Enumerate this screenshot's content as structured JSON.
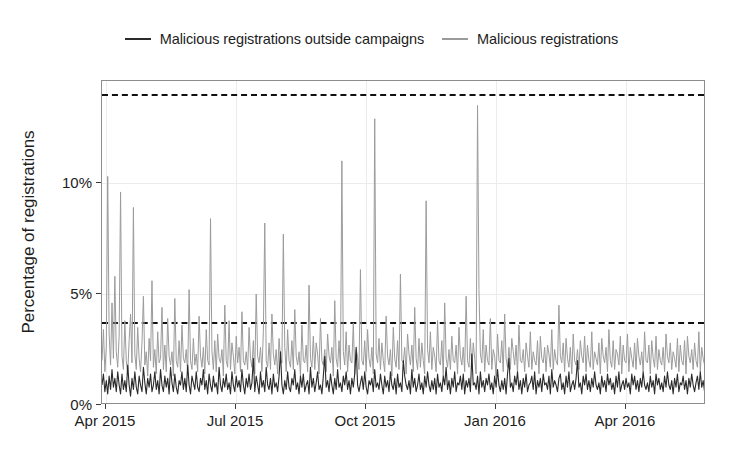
{
  "chart_data": {
    "type": "line",
    "title": "",
    "xlabel": "",
    "ylabel": "Percentage of registrations",
    "ylim": [
      0,
      14.6
    ],
    "xlim": [
      "2015-03-20",
      "2016-06-05"
    ],
    "grid": true,
    "legend_position": "top-center",
    "y_ticks": [
      {
        "value": 0,
        "label": "0%"
      },
      {
        "value": 5,
        "label": "5%"
      },
      {
        "value": 10,
        "label": "10%"
      }
    ],
    "x_ticks": [
      {
        "value": "2015-04-01",
        "label": "Apr 2015"
      },
      {
        "value": "2015-07-01",
        "label": "Jul 2015"
      },
      {
        "value": "2015-10-01",
        "label": "Oct 2015"
      },
      {
        "value": "2016-01-01",
        "label": "Jan 2016"
      },
      {
        "value": "2016-04-01",
        "label": "Apr 2016"
      }
    ],
    "annotations": [
      {
        "name": "upper-threshold",
        "type": "hline",
        "value": 14.0,
        "style": "dashed",
        "color": "#111111"
      },
      {
        "name": "lower-threshold",
        "type": "hline",
        "value": 3.75,
        "style": "dashed",
        "color": "#111111"
      }
    ],
    "series": [
      {
        "name": "Malicious registrations outside campaigns",
        "color": "#2b2b2b",
        "values": [
          0.9,
          1.4,
          0.6,
          1.1,
          0.5,
          1.3,
          0.7,
          1.6,
          0.8,
          1.2,
          0.6,
          1.5,
          0.9,
          0.5,
          1.4,
          0.7,
          1.1,
          0.6,
          1.8,
          0.9,
          0.4,
          1.2,
          0.7,
          1.5,
          0.8,
          0.5,
          1.3,
          0.9,
          0.6,
          1.7,
          1.0,
          0.5,
          1.2,
          0.8,
          1.4,
          0.6,
          0.9,
          1.5,
          0.7,
          1.1,
          0.5,
          1.6,
          0.9,
          0.6,
          1.3,
          0.8,
          1.2,
          0.5,
          1.7,
          1.0,
          0.6,
          1.4,
          0.8,
          0.5,
          1.1,
          0.9,
          1.5,
          0.7,
          1.2,
          0.6,
          1.8,
          0.9,
          0.5,
          1.3,
          1.0,
          0.7,
          1.5,
          0.8,
          0.6,
          1.2,
          0.9,
          1.6,
          0.7,
          1.1,
          0.5,
          1.4,
          0.9,
          0.6,
          1.3,
          0.8,
          1.0,
          0.5,
          1.7,
          0.9,
          0.6,
          1.2,
          0.8,
          1.4,
          0.7,
          1.0,
          0.5,
          1.5,
          0.9,
          0.6,
          1.3,
          0.8,
          1.1,
          0.6,
          1.6,
          0.9,
          0.5,
          1.2,
          0.8,
          1.4,
          0.7,
          1.0,
          2.1,
          0.6,
          1.3,
          0.9,
          0.5,
          1.5,
          0.8,
          1.1,
          0.6,
          1.7,
          0.9,
          0.7,
          1.2,
          0.5,
          1.4,
          0.8,
          1.0,
          0.6,
          1.3,
          2.4,
          0.9,
          0.5,
          1.1,
          0.7,
          1.5,
          0.8,
          0.6,
          1.2,
          0.9,
          1.6,
          0.7,
          1.0,
          0.5,
          1.3,
          0.8,
          1.4,
          0.6,
          0.9,
          1.1,
          0.5,
          1.7,
          0.8,
          1.2,
          0.6,
          1.0,
          1.5,
          0.7,
          0.9,
          0.5,
          1.3,
          2.2,
          0.8,
          1.1,
          0.6,
          1.4,
          0.9,
          0.5,
          1.2,
          0.7,
          1.6,
          0.8,
          1.0,
          0.6,
          1.3,
          0.9,
          1.5,
          0.7,
          1.1,
          0.5,
          1.2,
          0.8,
          1.4,
          2.6,
          0.9,
          0.6,
          1.0,
          1.3,
          0.7,
          1.5,
          0.8,
          0.5,
          1.1,
          0.9,
          1.2,
          0.6,
          1.6,
          0.8,
          1.0,
          0.7,
          1.4,
          0.9,
          0.5,
          1.3,
          0.8,
          1.1,
          0.6,
          1.5,
          0.9,
          0.7,
          1.2,
          0.5,
          1.4,
          0.8,
          1.0,
          0.6,
          2.0,
          1.3,
          0.9,
          0.7,
          1.1,
          0.5,
          1.6,
          0.8,
          1.2,
          0.6,
          0.9,
          1.4,
          0.7,
          1.0,
          0.5,
          1.3,
          0.8,
          1.5,
          0.9,
          0.6,
          1.1,
          0.7,
          1.2,
          0.5,
          1.4,
          0.8,
          1.0,
          0.6,
          1.3,
          0.9,
          1.7,
          0.7,
          1.1,
          0.5,
          1.2,
          0.8,
          1.5,
          0.6,
          1.0,
          0.9,
          1.3,
          0.7,
          1.4,
          0.5,
          1.1,
          0.8,
          1.2,
          0.6,
          2.3,
          0.9,
          1.0,
          0.7,
          1.3,
          0.5,
          1.5,
          0.8,
          1.1,
          0.6,
          1.2,
          0.9,
          1.4,
          0.7,
          1.0,
          0.5,
          1.3,
          0.8,
          1.6,
          0.9,
          0.6,
          1.1,
          0.7,
          1.2,
          0.5,
          1.4,
          2.1,
          0.8,
          1.0,
          0.6,
          1.3,
          0.9,
          1.5,
          0.7,
          1.1,
          0.5,
          1.2,
          0.8,
          1.4,
          0.6,
          0.9,
          1.0,
          1.3,
          0.7,
          1.5,
          0.5,
          1.1,
          0.8,
          1.2,
          0.6,
          1.4,
          0.9,
          1.0,
          0.7,
          1.3,
          0.5,
          1.6,
          0.8,
          1.1,
          0.9,
          0.6,
          1.2,
          1.4,
          0.7,
          1.0,
          0.5,
          1.3,
          0.8,
          1.5,
          0.6,
          0.9,
          1.1,
          0.7,
          1.2,
          2.0,
          0.8,
          1.0,
          0.5,
          1.3,
          0.9,
          1.4,
          0.7,
          1.1,
          0.6,
          1.2,
          0.8,
          1.5,
          0.9,
          0.7,
          1.0,
          0.5,
          1.3,
          0.8,
          1.1,
          0.6,
          1.4,
          0.9,
          1.2,
          0.7,
          1.0,
          0.5,
          1.3,
          0.8,
          1.5,
          0.6,
          0.9,
          1.1,
          0.7,
          1.2,
          0.8,
          1.0,
          0.5,
          1.4,
          0.9,
          1.3,
          0.7,
          1.1,
          0.6,
          1.2,
          0.8,
          1.5,
          0.9,
          0.7,
          1.0,
          0.6,
          1.3,
          0.8,
          1.1,
          0.5,
          1.4,
          0.9,
          1.2,
          0.7,
          1.0,
          0.6,
          1.3,
          0.8,
          1.5,
          0.9,
          0.7,
          1.1,
          0.5,
          1.2,
          0.8,
          1.4,
          0.6,
          1.0,
          0.9,
          1.3,
          0.7,
          1.1,
          0.5,
          1.2,
          0.8,
          1.4,
          0.9,
          0.6,
          1.0,
          1.3,
          0.7,
          1.5,
          0.8,
          1.1,
          0.6,
          1.2
        ]
      },
      {
        "name": "Malicious registrations",
        "color": "#9b9b9b",
        "values": [
          2.0,
          3.4,
          1.5,
          2.6,
          10.3,
          3.2,
          1.8,
          4.6,
          2.1,
          5.8,
          2.4,
          1.7,
          3.1,
          9.6,
          2.2,
          1.6,
          3.8,
          2.0,
          1.4,
          2.9,
          4.1,
          1.9,
          8.9,
          2.3,
          1.6,
          3.5,
          2.1,
          1.5,
          2.8,
          4.9,
          1.8,
          2.4,
          1.3,
          3.0,
          2.0,
          5.6,
          1.7,
          2.5,
          1.4,
          3.3,
          1.9,
          2.1,
          4.4,
          1.6,
          2.7,
          1.5,
          3.9,
          2.2,
          1.8,
          2.4,
          1.3,
          4.8,
          2.0,
          1.7,
          2.9,
          1.5,
          3.6,
          2.1,
          1.9,
          2.5,
          1.4,
          5.2,
          2.0,
          1.6,
          3.0,
          1.8,
          2.3,
          1.5,
          4.0,
          2.2,
          1.7,
          2.6,
          1.4,
          3.4,
          2.0,
          1.8,
          8.4,
          2.4,
          1.6,
          2.9,
          1.5,
          3.2,
          2.1,
          1.9,
          2.5,
          1.3,
          4.5,
          2.0,
          1.7,
          3.8,
          1.6,
          2.8,
          2.2,
          1.4,
          3.1,
          1.9,
          2.6,
          1.5,
          4.2,
          2.0,
          1.8,
          2.4,
          1.6,
          3.5,
          2.1,
          1.7,
          2.9,
          1.4,
          5.0,
          2.2,
          1.9,
          2.6,
          1.5,
          3.3,
          8.2,
          2.0,
          1.7,
          2.8,
          1.6,
          4.1,
          2.3,
          1.8,
          2.5,
          1.4,
          3.0,
          2.1,
          1.9,
          7.7,
          2.6,
          1.5,
          3.4,
          2.0,
          1.7,
          2.9,
          1.6,
          4.3,
          2.2,
          1.8,
          2.4,
          1.3,
          3.6,
          2.0,
          1.9,
          2.7,
          1.5,
          5.4,
          2.1,
          1.7,
          3.1,
          1.6,
          2.8,
          2.3,
          1.4,
          3.9,
          2.0,
          1.8,
          2.5,
          1.5,
          3.2,
          2.2,
          1.9,
          2.6,
          1.3,
          4.7,
          2.1,
          1.7,
          2.9,
          1.6,
          11.0,
          2.4,
          1.8,
          3.3,
          1.5,
          2.7,
          2.0,
          1.9,
          3.7,
          1.4,
          2.5,
          2.2,
          1.6,
          6.1,
          2.0,
          1.8,
          2.9,
          1.5,
          3.4,
          2.1,
          1.7,
          2.6,
          1.4,
          12.9,
          2.3,
          1.9,
          3.0,
          1.6,
          2.8,
          2.0,
          1.5,
          4.0,
          2.2,
          1.8,
          2.5,
          1.3,
          3.5,
          2.1,
          1.7,
          2.9,
          1.6,
          5.9,
          2.0,
          1.9,
          2.6,
          1.4,
          3.2,
          2.3,
          1.8,
          2.7,
          1.5,
          4.4,
          2.1,
          1.6,
          3.0,
          1.7,
          2.8,
          2.0,
          1.4,
          9.2,
          2.5,
          1.9,
          3.3,
          1.6,
          2.6,
          2.2,
          1.5,
          3.8,
          2.0,
          1.8,
          2.9,
          1.3,
          4.6,
          2.1,
          1.7,
          2.5,
          1.6,
          3.1,
          2.0,
          1.9,
          2.7,
          1.4,
          3.5,
          2.2,
          1.8,
          2.6,
          1.5,
          4.9,
          2.0,
          1.7,
          3.0,
          1.6,
          2.8,
          2.1,
          1.4,
          13.5,
          5.2,
          2.3,
          1.9,
          3.4,
          1.5,
          2.7,
          2.0,
          1.8,
          3.9,
          1.6,
          2.5,
          2.2,
          1.3,
          3.2,
          2.0,
          1.9,
          2.9,
          1.5,
          4.1,
          2.1,
          1.7,
          2.6,
          1.6,
          3.0,
          2.4,
          1.8,
          2.7,
          1.4,
          3.6,
          2.0,
          1.9,
          2.5,
          1.5,
          2.8,
          2.2,
          1.7,
          3.3,
          1.6,
          2.4,
          2.0,
          1.8,
          2.9,
          1.4,
          3.1,
          2.1,
          1.9,
          2.6,
          1.5,
          2.7,
          2.3,
          1.7,
          3.4,
          1.6,
          2.5,
          2.0,
          1.8,
          4.5,
          2.2,
          1.9,
          2.8,
          1.5,
          3.0,
          2.1,
          1.7,
          2.6,
          1.4,
          3.2,
          2.0,
          1.8,
          2.5,
          1.6,
          2.9,
          2.2,
          1.9,
          3.1,
          1.5,
          2.7,
          2.0,
          1.7,
          3.3,
          1.6,
          2.4,
          2.1,
          1.8,
          2.8,
          1.4,
          3.0,
          2.2,
          1.9,
          2.6,
          1.5,
          3.4,
          2.0,
          1.7,
          2.9,
          1.6,
          2.5,
          2.3,
          1.8,
          3.1,
          1.4,
          2.7,
          2.0,
          1.9,
          3.2,
          1.5,
          2.6,
          2.1,
          1.7,
          2.8,
          1.6,
          3.0,
          2.2,
          1.8,
          2.4,
          1.5,
          3.3,
          2.0,
          1.9,
          2.7,
          1.4,
          2.9,
          2.1,
          1.7,
          3.1,
          1.6,
          2.5,
          2.0,
          1.8,
          2.6,
          1.5,
          3.2,
          2.2,
          1.9,
          2.8,
          1.6,
          2.4,
          2.1,
          1.7,
          3.0,
          1.5,
          2.7,
          2.0,
          1.8,
          2.9,
          1.4,
          3.1,
          2.2,
          1.9,
          2.5,
          1.6,
          2.8,
          2.0,
          1.7,
          3.3,
          1.5,
          2.6,
          2.1,
          1.8,
          2.9
        ]
      }
    ]
  },
  "legend": {
    "entries": [
      {
        "label": "Malicious registrations outside campaigns",
        "color": "#2b2b2b"
      },
      {
        "label": "Malicious registrations",
        "color": "#9b9b9b"
      }
    ]
  },
  "axes": {
    "y_title": "Percentage of registrations"
  }
}
